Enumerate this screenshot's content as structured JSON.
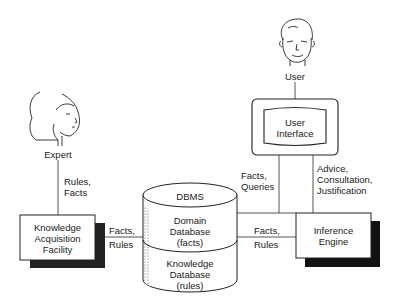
{
  "diagram": {
    "type": "expert-system-architecture",
    "nodes": {
      "expert": {
        "label": "Expert",
        "icon": "female-face-icon"
      },
      "user": {
        "label": "User",
        "icon": "male-face-icon"
      },
      "kaf": {
        "line1": "Knowledge",
        "line2": "Acquisition",
        "line3": "Facility"
      },
      "ui": {
        "line1": "User",
        "line2": "Interface"
      },
      "ie": {
        "line1": "Inference",
        "line2": "Engine"
      },
      "dbms": {
        "title": "DBMS",
        "domain": {
          "line1": "Domain",
          "line2": "Database",
          "line3": "(facts)"
        },
        "knowledge": {
          "line1": "Knowledge",
          "line2": "Database",
          "line3": "(rules)"
        }
      }
    },
    "edges": {
      "expert_kaf": {
        "line1": "Rules,",
        "line2": "Facts"
      },
      "kaf_dbms": {
        "line1": "Facts,",
        "line2": "Rules"
      },
      "dbms_ie": {
        "line1": "Facts,",
        "line2": "Rules"
      },
      "ui_dbms": {
        "line1": "Facts,",
        "line2": "Queries"
      },
      "ui_ie": {
        "line1": "Advice,",
        "line2": "Consultation,",
        "line3": "Justification"
      }
    }
  }
}
